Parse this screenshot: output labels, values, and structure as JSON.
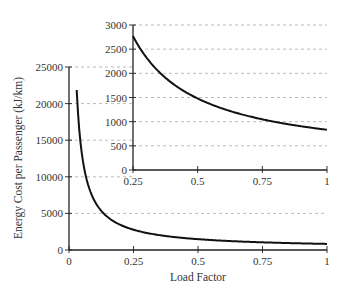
{
  "chart_data": [
    {
      "type": "line",
      "title": "",
      "xlabel": "Load Factor",
      "ylabel": "Energy Cost per Passenger (kJ/km)",
      "xlim": [
        0,
        1
      ],
      "ylim": [
        0,
        25000
      ],
      "x_ticks": [
        "0",
        "0.25",
        "0.5",
        "0.75",
        "1"
      ],
      "y_ticks": [
        "0",
        "5000",
        "10000",
        "15000",
        "20000",
        "25000"
      ],
      "grid": "horizontal dashed",
      "series": [
        {
          "name": "Energy cost",
          "x": [
            0.03,
            0.05,
            0.1,
            0.15,
            0.25,
            0.5,
            0.75,
            1.0
          ],
          "y": [
            23200,
            13100,
            6650,
            4500,
            2770,
            1480,
            1050,
            833
          ]
        }
      ]
    },
    {
      "type": "line",
      "title": "",
      "xlabel": "",
      "ylabel": "",
      "xlim": [
        0.25,
        1
      ],
      "ylim": [
        0,
        3000
      ],
      "x_ticks": [
        "0.25",
        "0.5",
        "0.75",
        "1"
      ],
      "y_ticks": [
        "0",
        "500",
        "1000",
        "1500",
        "2000",
        "2500",
        "3000"
      ],
      "grid": "horizontal dashed",
      "series": [
        {
          "name": "Energy cost (zoom)",
          "x": [
            0.25,
            0.5,
            0.75,
            1.0
          ],
          "y": [
            2770,
            1480,
            1050,
            833
          ]
        }
      ]
    }
  ]
}
